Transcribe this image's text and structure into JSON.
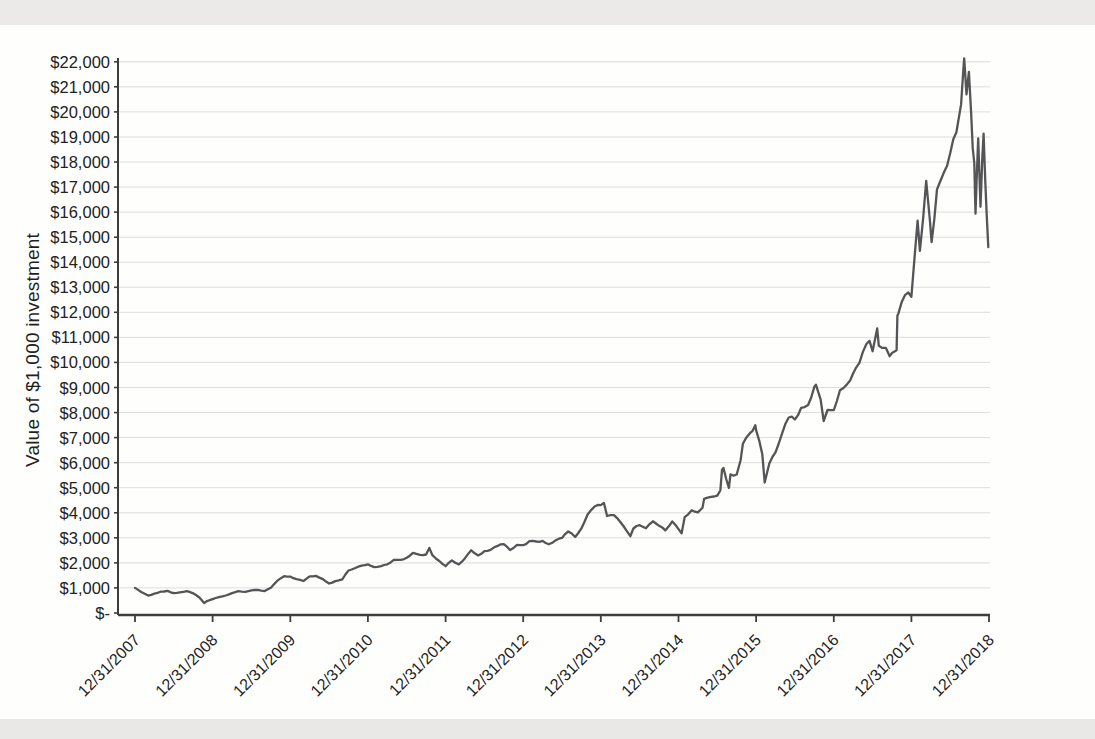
{
  "page": {
    "background_color": "#fefefd",
    "top_band_color": "#ebeae8",
    "bottom_band_color": "#e9e8e6"
  },
  "chart_data": {
    "type": "line",
    "title": "",
    "xlabel": "",
    "ylabel": "Value of $1,000 investment",
    "ylim": [
      0,
      22000
    ],
    "y_tick_interval": 1000,
    "grid": "horizontal",
    "legend": "none",
    "x_tick_labels": [
      "12/31/2007",
      "12/31/2008",
      "12/31/2009",
      "12/31/2010",
      "12/31/2011",
      "12/31/2012",
      "12/31/2013",
      "12/31/2014",
      "12/31/2015",
      "12/31/2016",
      "12/31/2017",
      "12/31/2018"
    ],
    "y_tick_labels": [
      "$22,000",
      "$21,000",
      "$20,000",
      "$19,000",
      "$18,000",
      "$17,000",
      "$16,000",
      "$15,000",
      "$14,000",
      "$13,000",
      "$12,000",
      "$11,000",
      "$10,000",
      "$9,000",
      "$8,000",
      "$7,000",
      "$6,000",
      "$5,000",
      "$4,000",
      "$3,000",
      "$2,000",
      "$1,000",
      "$-"
    ],
    "series": [
      {
        "name": "Value of $1,000 investment",
        "x_unit": "years_after_12/31/2007",
        "points": [
          [
            0.0,
            1000
          ],
          [
            0.08,
            839
          ],
          [
            0.17,
            696
          ],
          [
            0.25,
            770
          ],
          [
            0.33,
            849
          ],
          [
            0.42,
            881
          ],
          [
            0.5,
            792
          ],
          [
            0.58,
            824
          ],
          [
            0.67,
            872
          ],
          [
            0.75,
            785
          ],
          [
            0.83,
            618
          ],
          [
            0.89,
            395
          ],
          [
            0.92,
            461
          ],
          [
            1.0,
            554
          ],
          [
            1.08,
            635
          ],
          [
            1.17,
            699
          ],
          [
            1.25,
            793
          ],
          [
            1.33,
            869
          ],
          [
            1.42,
            842
          ],
          [
            1.5,
            903
          ],
          [
            1.58,
            926
          ],
          [
            1.67,
            876
          ],
          [
            1.75,
            1008
          ],
          [
            1.83,
            1283
          ],
          [
            1.92,
            1467
          ],
          [
            2.0,
            1452
          ],
          [
            2.08,
            1354
          ],
          [
            2.17,
            1278
          ],
          [
            2.25,
            1466
          ],
          [
            2.33,
            1480
          ],
          [
            2.42,
            1354
          ],
          [
            2.5,
            1179
          ],
          [
            2.58,
            1273
          ],
          [
            2.67,
            1347
          ],
          [
            2.75,
            1695
          ],
          [
            2.83,
            1784
          ],
          [
            2.92,
            1893
          ],
          [
            3.0,
            1943
          ],
          [
            3.08,
            1831
          ],
          [
            3.17,
            1871
          ],
          [
            3.25,
            1944
          ],
          [
            3.33,
            2114
          ],
          [
            3.42,
            2123
          ],
          [
            3.5,
            2207
          ],
          [
            3.58,
            2402
          ],
          [
            3.67,
            2323
          ],
          [
            3.75,
            2334
          ],
          [
            3.79,
            2600
          ],
          [
            3.83,
            2305
          ],
          [
            3.92,
            2076
          ],
          [
            4.0,
            1868
          ],
          [
            4.08,
            2099
          ],
          [
            4.17,
            1940
          ],
          [
            4.25,
            2186
          ],
          [
            4.33,
            2503
          ],
          [
            4.42,
            2298
          ],
          [
            4.5,
            2465
          ],
          [
            4.58,
            2518
          ],
          [
            4.67,
            2680
          ],
          [
            4.75,
            2745
          ],
          [
            4.83,
            2514
          ],
          [
            4.92,
            2721
          ],
          [
            5.0,
            2708
          ],
          [
            5.08,
            2866
          ],
          [
            5.17,
            2853
          ],
          [
            5.25,
            2877
          ],
          [
            5.33,
            2740
          ],
          [
            5.42,
            2906
          ],
          [
            5.5,
            2998
          ],
          [
            5.58,
            3252
          ],
          [
            5.67,
            3033
          ],
          [
            5.75,
            3375
          ],
          [
            5.83,
            3930
          ],
          [
            5.92,
            4249
          ],
          [
            6.0,
            4305
          ],
          [
            6.04,
            4393
          ],
          [
            6.08,
            3872
          ],
          [
            6.17,
            3909
          ],
          [
            6.25,
            3631
          ],
          [
            6.33,
            3283
          ],
          [
            6.38,
            3066
          ],
          [
            6.42,
            3374
          ],
          [
            6.5,
            3506
          ],
          [
            6.58,
            3379
          ],
          [
            6.67,
            3660
          ],
          [
            6.75,
            3481
          ],
          [
            6.83,
            3297
          ],
          [
            6.92,
            3656
          ],
          [
            7.0,
            3350
          ],
          [
            7.04,
            3180
          ],
          [
            7.08,
            3827
          ],
          [
            7.17,
            4104
          ],
          [
            7.25,
            4017
          ],
          [
            7.31,
            4200
          ],
          [
            7.33,
            4553
          ],
          [
            7.42,
            4634
          ],
          [
            7.5,
            4686
          ],
          [
            7.54,
            4900
          ],
          [
            7.56,
            5715
          ],
          [
            7.58,
            5788
          ],
          [
            7.65,
            4999
          ],
          [
            7.67,
            5537
          ],
          [
            7.75,
            5526
          ],
          [
            7.8,
            6100
          ],
          [
            7.83,
            6757
          ],
          [
            7.92,
            7177
          ],
          [
            7.99,
            7492
          ],
          [
            8.0,
            7297
          ],
          [
            8.08,
            6337
          ],
          [
            8.11,
            5204
          ],
          [
            8.17,
            5965
          ],
          [
            8.25,
            6408
          ],
          [
            8.33,
            7121
          ],
          [
            8.42,
            7803
          ],
          [
            8.5,
            7725
          ],
          [
            8.58,
            8191
          ],
          [
            8.67,
            8303
          ],
          [
            8.75,
            9038
          ],
          [
            8.77,
            9111
          ],
          [
            8.83,
            8526
          ],
          [
            8.87,
            7665
          ],
          [
            8.92,
            8102
          ],
          [
            9.0,
            8094
          ],
          [
            9.08,
            8889
          ],
          [
            9.17,
            9122
          ],
          [
            9.25,
            9570
          ],
          [
            9.33,
            9985
          ],
          [
            9.42,
            10737
          ],
          [
            9.46,
            10860
          ],
          [
            9.5,
            10449
          ],
          [
            9.56,
            11356
          ],
          [
            9.58,
            10663
          ],
          [
            9.67,
            10585
          ],
          [
            9.72,
            10250
          ],
          [
            9.75,
            10377
          ],
          [
            9.81,
            10490
          ],
          [
            9.82,
            11874
          ],
          [
            9.83,
            11931
          ],
          [
            9.92,
            12702
          ],
          [
            10.0,
            12624
          ],
          [
            10.08,
            15662
          ],
          [
            10.11,
            14454
          ],
          [
            10.19,
            17249
          ],
          [
            10.24,
            15620
          ],
          [
            10.26,
            14800
          ],
          [
            10.33,
            16906
          ],
          [
            10.42,
            17591
          ],
          [
            10.5,
            18349
          ],
          [
            10.58,
            19187
          ],
          [
            10.64,
            20300
          ],
          [
            10.67,
            21726
          ],
          [
            10.68,
            22135
          ],
          [
            10.71,
            20700
          ],
          [
            10.74,
            21600
          ],
          [
            10.77,
            19900
          ],
          [
            10.79,
            18558
          ],
          [
            10.81,
            17961
          ],
          [
            10.825,
            15937
          ],
          [
            10.84,
            17250
          ],
          [
            10.86,
            18944
          ],
          [
            10.89,
            16214
          ],
          [
            10.915,
            18245
          ],
          [
            10.93,
            19129
          ],
          [
            10.95,
            17300
          ],
          [
            10.97,
            15900
          ],
          [
            10.99,
            14600
          ]
        ]
      }
    ],
    "layout": {
      "plot": {
        "y_axis_x": 118,
        "x_axis_y": 615,
        "x_right": 990,
        "y_axis_top": 58,
        "x_first_tick": 135,
        "x_per_year": 77.64,
        "y_zero": 613,
        "px_per_dollar": 0.025055
      },
      "colors": {
        "line": "#555557",
        "grid": "#d8d8d8",
        "axis": "#3d3d3d",
        "text": "#222222"
      },
      "fonts": {
        "tick_px": 16,
        "y_tick_px": 16.5
      },
      "noise": {
        "seed": 13,
        "amp": 0.011,
        "step_px": 2.4
      }
    }
  }
}
